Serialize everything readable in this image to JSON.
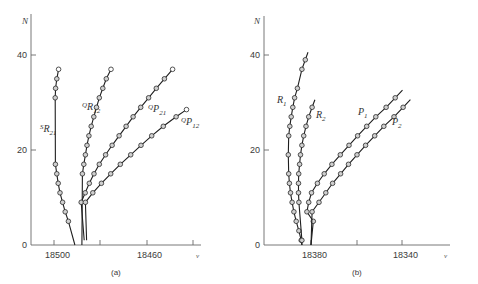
{
  "chart_data": [
    {
      "panel": "a",
      "type": "scatter",
      "caption": "(a)",
      "xlabel": "ν",
      "ylabel": "N",
      "x_reversed": true,
      "xticks": [
        18500,
        18480,
        18460,
        18440
      ],
      "xtick_labels": [
        "18500",
        "18460"
      ],
      "yticks": [
        0,
        20,
        40
      ],
      "ytick_labels": [
        "0",
        "20",
        "40"
      ],
      "xlim": [
        18510,
        18437
      ],
      "ylim": [
        0,
        47
      ],
      "grid": false,
      "series": [
        {
          "name": "SR21",
          "label_main": "S",
          "label_letter": "R",
          "label_sub": "21",
          "label_pos": [
            40,
            132
          ],
          "points": [
            [
              18498,
              37
            ],
            [
              18498.8,
              35
            ],
            [
              18499.3,
              33
            ],
            [
              18499.5,
              31
            ],
            [
              18499.4,
              17
            ],
            [
              18498.8,
              15
            ],
            [
              18498.2,
              13
            ],
            [
              18497.4,
              11
            ],
            [
              18496.3,
              9
            ],
            [
              18495.2,
              7
            ],
            [
              18493.8,
              5
            ]
          ],
          "open_points": [
            [
              18498,
              37
            ]
          ],
          "origin": [
            18491,
            0
          ]
        },
        {
          "name": "QR12",
          "label_main": "Q",
          "label_letter": "R",
          "label_sub": "12",
          "label_pos": [
            82,
            110
          ],
          "points": [
            [
              18475.5,
              37
            ],
            [
              18477.5,
              35
            ],
            [
              18479,
              33
            ],
            [
              18480.5,
              31
            ],
            [
              18481.7,
              29
            ],
            [
              18482.9,
              27
            ],
            [
              18484,
              25
            ],
            [
              18485,
              23
            ],
            [
              18485.8,
              21
            ],
            [
              18486.5,
              19
            ],
            [
              18487.2,
              17
            ],
            [
              18487.8,
              15
            ]
          ],
          "open_points": [
            [
              18475.5,
              37
            ]
          ],
          "origin": [
            18488,
            0
          ]
        },
        {
          "name": "QP21",
          "label_main": "Q",
          "label_letter": "P",
          "label_sub": "21",
          "label_pos": [
            148,
            112
          ],
          "points": [
            [
              18449,
              37
            ],
            [
              18452.5,
              35
            ],
            [
              18456,
              33
            ],
            [
              18459.3,
              31
            ],
            [
              18462.7,
              29
            ],
            [
              18466,
              27
            ],
            [
              18469,
              25
            ],
            [
              18472,
              23
            ],
            [
              18475,
              21
            ],
            [
              18477.8,
              19
            ],
            [
              18480.5,
              17
            ],
            [
              18482.8,
              15
            ],
            [
              18484.8,
              13
            ],
            [
              18486.6,
              11
            ],
            [
              18488.3,
              9
            ]
          ],
          "open_points": [
            [
              18449,
              37
            ]
          ],
          "origin": [
            18487,
            1
          ]
        },
        {
          "name": "QP12",
          "label_main": "Q",
          "label_letter": "P",
          "label_sub": "12",
          "label_pos": [
            181,
            125
          ],
          "points": [
            [
              18443,
              28.5
            ],
            [
              18447.5,
              27
            ],
            [
              18453,
              25
            ],
            [
              18458,
              23
            ],
            [
              18462.6,
              21
            ],
            [
              18467,
              19
            ],
            [
              18471.5,
              17
            ],
            [
              18475.6,
              15
            ],
            [
              18479.6,
              13
            ],
            [
              18483.3,
              11
            ],
            [
              18486.5,
              9
            ]
          ],
          "open_points": [
            [
              18443,
              28.5
            ]
          ],
          "origin": [
            18486,
            1
          ]
        }
      ]
    },
    {
      "panel": "b",
      "type": "scatter",
      "caption": "(b)",
      "xlabel": "ν",
      "ylabel": "N",
      "x_reversed": true,
      "xticks": [
        18380,
        18360,
        18340
      ],
      "xtick_labels": [
        "18380",
        "18340"
      ],
      "yticks": [
        0,
        20,
        40
      ],
      "ytick_labels": [
        "0",
        "20",
        "40"
      ],
      "xlim": [
        18400,
        18326
      ],
      "ylim": [
        0,
        47
      ],
      "grid": false,
      "series": [
        {
          "name": "R1",
          "label_letter": "R",
          "label_sub": "1",
          "label_pos": [
            277,
            103
          ],
          "points": [
            [
              18382.5,
              39
            ],
            [
              18384,
              37
            ],
            [
              18386,
              33
            ],
            [
              18387.2,
              31
            ],
            [
              18388,
              29
            ],
            [
              18388.7,
              27
            ],
            [
              18389.3,
              25
            ],
            [
              18389.8,
              23
            ],
            [
              18390,
              19
            ],
            [
              18389.8,
              15
            ],
            [
              18389.5,
              13
            ],
            [
              18389,
              11
            ],
            [
              18388.3,
              9
            ],
            [
              18387.5,
              7
            ],
            [
              18386.5,
              5
            ],
            [
              18385.3,
              3
            ],
            [
              18384.3,
              1
            ]
          ],
          "open_points": [],
          "origin": [
            18384,
            0
          ]
        },
        {
          "name": "R2",
          "label_letter": "R",
          "label_sub": "2",
          "label_pos": [
            316,
            118
          ],
          "points": [
            [
              18379.5,
              29
            ],
            [
              18381,
              27
            ],
            [
              18382.2,
              25
            ],
            [
              18383.2,
              23
            ],
            [
              18384,
              21
            ],
            [
              18384.6,
              19
            ],
            [
              18385,
              17
            ],
            [
              18385.4,
              15
            ],
            [
              18385.5,
              13
            ],
            [
              18385.5,
              11
            ],
            [
              18385.3,
              9
            ],
            [
              18384,
              1
            ]
          ],
          "open_points": [],
          "origin": [
            18384,
            0
          ]
        },
        {
          "name": "P1",
          "label_letter": "P",
          "label_sub": "1",
          "label_pos": [
            358,
            115
          ],
          "points": [
            [
              18343,
              31
            ],
            [
              18347,
              29
            ],
            [
              18351.5,
              27
            ],
            [
              18355.5,
              25
            ],
            [
              18359.5,
              23
            ],
            [
              18363.3,
              21
            ],
            [
              18367.1,
              19
            ],
            [
              18370.8,
              17
            ],
            [
              18374.2,
              15
            ],
            [
              18377.2,
              13
            ],
            [
              18379.8,
              11
            ],
            [
              18381,
              9
            ],
            [
              18381.8,
              7
            ],
            [
              18379,
              5
            ]
          ],
          "open_points": [],
          "origin": [
            18380,
            0
          ]
        },
        {
          "name": "P2",
          "label_letter": "P",
          "label_sub": "2",
          "label_pos": [
            392,
            125
          ],
          "points": [
            [
              18339.5,
              29
            ],
            [
              18343.5,
              27
            ],
            [
              18348,
              25
            ],
            [
              18352,
              23
            ],
            [
              18356,
              21
            ],
            [
              18359.8,
              19
            ],
            [
              18363.5,
              17
            ],
            [
              18367,
              15
            ],
            [
              18370.5,
              13
            ],
            [
              18373.5,
              11
            ],
            [
              18376.5,
              9
            ],
            [
              18379.5,
              7
            ]
          ],
          "open_points": [],
          "origin": [
            18380,
            0
          ]
        }
      ]
    }
  ],
  "panels": {
    "a": {
      "caption": "(a)",
      "y_axis_label": "N",
      "x_axis_label": "ν",
      "tick_18500": "18500",
      "tick_18460": "18460",
      "tick_0": "0",
      "tick_20": "20",
      "tick_40": "40"
    },
    "b": {
      "caption": "(b)",
      "y_axis_label": "N",
      "x_axis_label": "ν",
      "tick_18380": "18380",
      "tick_18340": "18340",
      "tick_0": "0",
      "tick_20": "20",
      "tick_40": "40"
    }
  }
}
